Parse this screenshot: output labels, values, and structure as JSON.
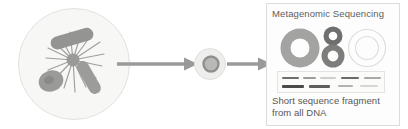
{
  "diagram": {
    "background_color": "#ffffff"
  },
  "nodes": {
    "community": {
      "name": "microbial-community-sample",
      "label": "",
      "fill_color": "#f7f7f6",
      "border_color": "#e2e2e0",
      "microbe_color": "#a8a8a6",
      "microbe_color_dark": "#8e8e8c"
    },
    "single_microbe": {
      "name": "single-microbe-cell",
      "label": "",
      "outer_color": "#ededeb",
      "ring_color": "#9b9b99",
      "core_color": "#b5b5b3"
    }
  },
  "arrows": {
    "first": {
      "label": "",
      "color": "#9a9a98"
    },
    "second": {
      "label": "",
      "color": "#9a9a98"
    }
  },
  "panel": {
    "title": "Metagenomic Sequencing",
    "background_color": "#fdfdfd",
    "border_color": "#dcdcda",
    "caption_line1": "Short sequence fragment",
    "caption_line2": "from all DNA",
    "rings": [
      {
        "name": "genome-ring-large",
        "cx": 28,
        "cy": 24,
        "r_outer": 19.5,
        "r_inner": 9.5,
        "color": "#a3a3a1"
      },
      {
        "name": "genome-ring-small-top",
        "cx": 61,
        "cy": 12,
        "r_outer": 9.5,
        "r_inner": 4.5,
        "color": "#6f6f6d"
      },
      {
        "name": "genome-ring-small-bot",
        "cx": 61,
        "cy": 32,
        "r_outer": 11.5,
        "r_inner": 5.5,
        "color": "#7d7d7b"
      },
      {
        "name": "genome-ring-outline",
        "cx": 95,
        "cy": 24,
        "r_outer": 18.5,
        "r_inner": 11.5,
        "color": "#dadad8"
      }
    ],
    "gel_bands": [
      {
        "name": "gel-band-r1-c1",
        "x": 4,
        "y": 5,
        "w": 17,
        "color": "#6e6e6c"
      },
      {
        "name": "gel-band-r1-c2",
        "x": 25,
        "y": 5,
        "w": 13,
        "color": "#9d9d9b"
      },
      {
        "name": "gel-band-r1-c3",
        "x": 42,
        "y": 5,
        "w": 16,
        "color": "#cfcfcd"
      },
      {
        "name": "gel-band-r1-c4",
        "x": 63,
        "y": 5,
        "w": 18,
        "color": "#6a6a68"
      },
      {
        "name": "gel-band-r1-c5",
        "x": 86,
        "y": 5,
        "w": 17,
        "color": "#a9a9a7"
      },
      {
        "name": "gel-band-r2-c1",
        "x": 4,
        "y": 13,
        "w": 22,
        "color": "#4a4a48"
      },
      {
        "name": "gel-band-r2-c2",
        "x": 31,
        "y": 13,
        "w": 21,
        "color": "#5e5e5c"
      },
      {
        "name": "gel-band-r2-c3",
        "x": 60,
        "y": 13,
        "w": 15,
        "color": "#b3b3b1"
      },
      {
        "name": "gel-band-r2-c4",
        "x": 82,
        "y": 13,
        "w": 18,
        "color": "#d6d6d4"
      }
    ]
  }
}
